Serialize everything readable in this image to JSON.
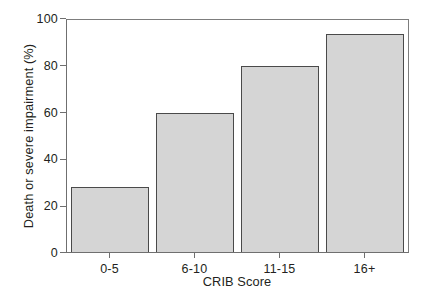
{
  "chart_data": {
    "type": "bar",
    "title": "",
    "xlabel": "CRIB Score",
    "ylabel": "Death or severe impairment (%)",
    "categories": [
      "0-5",
      "6-10",
      "11-15",
      "16+"
    ],
    "values": [
      28,
      60,
      80,
      94
    ],
    "ylim": [
      0,
      100
    ],
    "yticks": [
      0,
      20,
      40,
      60,
      80,
      100
    ],
    "ytick_labels": [
      "0",
      "20",
      "40",
      "60",
      "80",
      "100"
    ],
    "grid": false,
    "legend": null,
    "series": [
      {
        "name": "Death or severe impairment (%)",
        "values": [
          28,
          60,
          80,
          94
        ]
      }
    ],
    "colors": {
      "bar_fill": "#d5d5d5",
      "bar_edge": "#4a4a4a",
      "axis": "#6f6f6f",
      "text": "#231f20",
      "background": "#ffffff"
    }
  }
}
